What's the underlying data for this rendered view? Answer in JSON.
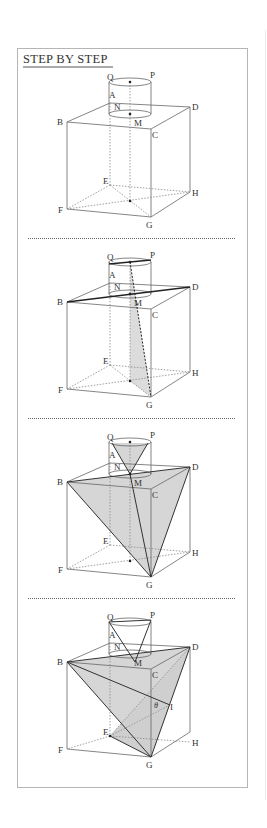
{
  "header": {
    "title": "STEP BY STEP"
  },
  "colors": {
    "frame": "#b5b5b5",
    "line": "#555555",
    "shade": "#d6d6d6",
    "dark_line": "#222222"
  },
  "labels": {
    "Q": "Q",
    "P": "P",
    "A": "A",
    "N": "N",
    "M": "M",
    "B": "B",
    "C": "C",
    "D": "D",
    "E": "E",
    "F": "F",
    "G": "G",
    "H": "H",
    "I": "I",
    "theta": "θ"
  },
  "panels": [
    {
      "step": 1,
      "description": "Cube BCDA-FGHE with cylinder on top face; axis through M and bottom center"
    },
    {
      "step": 2,
      "description": "Diagonal BD drawn, line from Q-P chord through M to G, shaded sliver"
    },
    {
      "step": 3,
      "description": "Triangle BDG shaded plane with cone from top circle to M"
    },
    {
      "step": 4,
      "description": "Plane BDG with point I on CG-side, angle θ at C, segments BI and EI"
    }
  ]
}
